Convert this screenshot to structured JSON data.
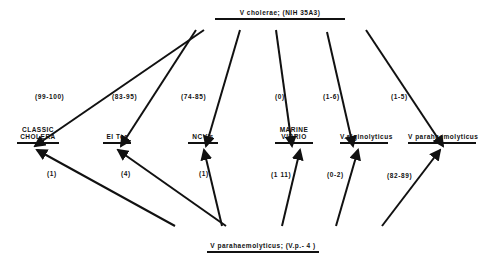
{
  "source_top": {
    "label": "V cholerae;  (NIH 35A3)"
  },
  "source_bottom": {
    "label": "V parahaemolyticus;  (V.p.- 4 )"
  },
  "targets": [
    {
      "line1": "CLASSIC",
      "line2": "CHOLERA"
    },
    {
      "line1": "",
      "line2": "El Tor"
    },
    {
      "line1": "",
      "line2": "NCV's"
    },
    {
      "line1": "MARINE",
      "line2": "VIBRIO"
    },
    {
      "line1": "",
      "line2": "V.alginolyticus"
    },
    {
      "line1": "",
      "line2": "V parahaemolyticus"
    }
  ],
  "top_percentages": [
    "(99-100)",
    "(83-95)",
    "(74-85)",
    "(0)",
    "(1-6)",
    "(1-5)"
  ],
  "bottom_percentages": [
    "(1)",
    "(4)",
    "(1)",
    "(1 11)",
    "(0-2)",
    "(82-89)"
  ]
}
